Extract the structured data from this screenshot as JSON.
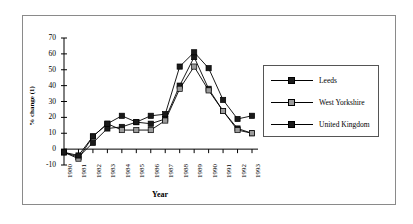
{
  "figure": {
    "frame_border_color": "#8a8a8a",
    "background": "#ffffff"
  },
  "chart_data": {
    "type": "line",
    "title": "",
    "xlabel": "Year",
    "ylabel": "% change (1)",
    "categories": [
      "1980",
      "1981",
      "1982",
      "1983",
      "1984",
      "1985",
      "1986",
      "1987",
      "1988",
      "1989",
      "1990",
      "1991",
      "1992",
      "1993"
    ],
    "x": [
      1980,
      1981,
      1982,
      1983,
      1984,
      1985,
      1986,
      1987,
      1988,
      1989,
      1990,
      1991,
      1992,
      1993
    ],
    "ylim": [
      -10,
      70
    ],
    "yticks": [
      -10,
      0,
      10,
      20,
      30,
      40,
      50,
      60,
      70
    ],
    "grid": false,
    "legend_position": "right",
    "marker": "square",
    "series": [
      {
        "name": "Leeds",
        "color": "#000000",
        "marker_fill": "#1a1a1a",
        "values": [
          -2,
          -5,
          4,
          13,
          14,
          17,
          16,
          19,
          40,
          58,
          38,
          24,
          13,
          10
        ]
      },
      {
        "name": "West Yorkshire",
        "color": "#000000",
        "marker_fill": "#9a9a9a",
        "values": [
          -2,
          -6,
          8,
          16,
          12,
          12,
          12,
          18,
          38,
          52,
          37,
          24,
          12,
          10
        ]
      },
      {
        "name": "United Kingdom",
        "color": "#000000",
        "marker_fill": "#1a1a1a",
        "values": [
          -2,
          -4,
          8,
          16,
          21,
          17,
          21,
          22,
          52,
          61,
          51,
          31,
          19,
          21
        ]
      }
    ]
  },
  "legend": {
    "items": [
      {
        "label": "Leeds"
      },
      {
        "label": "West Yorkshire"
      },
      {
        "label": "United Kingdom"
      }
    ]
  }
}
